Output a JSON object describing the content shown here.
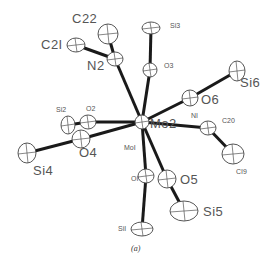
{
  "figure": {
    "caption": "(a)",
    "type": "ORTEP thermal ellipsoid plot",
    "central_atom": "Mo2",
    "atoms": [
      {
        "id": "Mo2",
        "label": "Mo2",
        "x": 142,
        "y": 122,
        "rx": 7,
        "ry": 7,
        "size": "big",
        "lx": 150,
        "ly": 117
      },
      {
        "id": "Mo1",
        "label": "MoI",
        "x": 138,
        "y": 122,
        "rx": 0,
        "ry": 0,
        "size": "small",
        "lx": 124,
        "ly": 144
      },
      {
        "id": "N2",
        "label": "N2",
        "x": 115,
        "y": 59,
        "rx": 8,
        "ry": 7,
        "size": "big",
        "lx": 87,
        "ly": 59
      },
      {
        "id": "C22",
        "label": "C22",
        "x": 108,
        "y": 34,
        "rx": 10,
        "ry": 10,
        "size": "big",
        "lx": 72,
        "ly": 12
      },
      {
        "id": "C21",
        "label": "C2I",
        "x": 76,
        "y": 45,
        "rx": 9,
        "ry": 7,
        "size": "big",
        "lx": 41,
        "ly": 38
      },
      {
        "id": "Si3",
        "label": "Si3",
        "x": 151,
        "y": 28,
        "rx": 9,
        "ry": 6,
        "size": "small",
        "lx": 170,
        "ly": 22
      },
      {
        "id": "O3",
        "label": "O3",
        "x": 150,
        "y": 70,
        "rx": 7,
        "ry": 7,
        "size": "small",
        "lx": 164,
        "ly": 62
      },
      {
        "id": "O6",
        "label": "O6",
        "x": 190,
        "y": 98,
        "rx": 8,
        "ry": 8,
        "size": "big",
        "lx": 201,
        "ly": 93
      },
      {
        "id": "Si6",
        "label": "Si6",
        "x": 237,
        "y": 71,
        "rx": 8,
        "ry": 10,
        "size": "big",
        "lx": 240,
        "ly": 76
      },
      {
        "id": "N1",
        "label": "NI",
        "x": 208,
        "y": 128,
        "rx": 8,
        "ry": 7,
        "size": "small",
        "lx": 191,
        "ly": 112
      },
      {
        "id": "C20",
        "label": "C20",
        "x": 212,
        "y": 126,
        "rx": 0,
        "ry": 0,
        "size": "small",
        "lx": 222,
        "ly": 117
      },
      {
        "id": "C19",
        "label": "CI9",
        "x": 233,
        "y": 154,
        "rx": 11,
        "ry": 10,
        "size": "small",
        "lx": 236,
        "ly": 168
      },
      {
        "id": "O2",
        "label": "O2",
        "x": 88,
        "y": 122,
        "rx": 8,
        "ry": 7,
        "size": "small",
        "lx": 86,
        "ly": 105
      },
      {
        "id": "Si2",
        "label": "Si2",
        "x": 68,
        "y": 125,
        "rx": 7,
        "ry": 9,
        "size": "small",
        "lx": 56,
        "ly": 106
      },
      {
        "id": "O4",
        "label": "O4",
        "x": 81,
        "y": 139,
        "rx": 9,
        "ry": 9,
        "size": "big",
        "lx": 79,
        "ly": 146
      },
      {
        "id": "Si4",
        "label": "Si4",
        "x": 27,
        "y": 153,
        "rx": 9,
        "ry": 10,
        "size": "big",
        "lx": 33,
        "ly": 164
      },
      {
        "id": "O1",
        "label": "OI",
        "x": 146,
        "y": 176,
        "rx": 8,
        "ry": 7,
        "size": "small",
        "lx": 131,
        "ly": 175
      },
      {
        "id": "O5",
        "label": "O5",
        "x": 167,
        "y": 179,
        "rx": 9,
        "ry": 9,
        "size": "big",
        "lx": 180,
        "ly": 173
      },
      {
        "id": "Si1",
        "label": "SiI",
        "x": 142,
        "y": 229,
        "rx": 11,
        "ry": 7,
        "size": "small",
        "lx": 118,
        "ly": 225
      },
      {
        "id": "Si5",
        "label": "Si5",
        "x": 184,
        "y": 211,
        "rx": 14,
        "ry": 10,
        "size": "big",
        "lx": 203,
        "ly": 205
      }
    ],
    "bonds": [
      [
        "Mo2",
        "N2"
      ],
      [
        "N2",
        "C22"
      ],
      [
        "N2",
        "C21"
      ],
      [
        "Mo2",
        "O3"
      ],
      [
        "O3",
        "Si3"
      ],
      [
        "Mo2",
        "O6"
      ],
      [
        "O6",
        "Si6"
      ],
      [
        "Mo2",
        "N1"
      ],
      [
        "N1",
        "C19"
      ],
      [
        "Mo2",
        "O2"
      ],
      [
        "O2",
        "Si2"
      ],
      [
        "Mo2",
        "O4"
      ],
      [
        "O4",
        "Si4"
      ],
      [
        "Mo2",
        "O1"
      ],
      [
        "O1",
        "Si1"
      ],
      [
        "Mo2",
        "O5"
      ],
      [
        "O5",
        "Si5"
      ]
    ]
  }
}
